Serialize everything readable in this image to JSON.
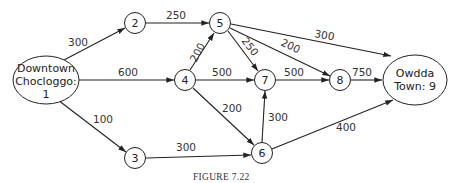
{
  "figure": {
    "caption": "Figure 7.22",
    "caption_display": "FIGURE 7.22"
  },
  "nodes": [
    {
      "id": "1",
      "label_lines": [
        "Downtown",
        "Chocloggo:",
        "1"
      ],
      "shape": "ellipse"
    },
    {
      "id": "2",
      "label": "2",
      "shape": "circle"
    },
    {
      "id": "3",
      "label": "3",
      "shape": "circle"
    },
    {
      "id": "4",
      "label": "4",
      "shape": "circle"
    },
    {
      "id": "5",
      "label": "5",
      "shape": "circle"
    },
    {
      "id": "6",
      "label": "6",
      "shape": "circle"
    },
    {
      "id": "7",
      "label": "7",
      "shape": "circle"
    },
    {
      "id": "8",
      "label": "8",
      "shape": "circle"
    },
    {
      "id": "9",
      "label_lines": [
        "Owdda",
        "Town: 9"
      ],
      "shape": "ellipse"
    }
  ],
  "edges": [
    {
      "from": "1",
      "to": "2",
      "weight": "300"
    },
    {
      "from": "1",
      "to": "4",
      "weight": "600"
    },
    {
      "from": "1",
      "to": "3",
      "weight": "100"
    },
    {
      "from": "2",
      "to": "5",
      "weight": "250"
    },
    {
      "from": "4",
      "to": "5",
      "weight": "200"
    },
    {
      "from": "4",
      "to": "7",
      "weight": "500"
    },
    {
      "from": "4",
      "to": "6",
      "weight": "200"
    },
    {
      "from": "5",
      "to": "7",
      "weight": "250"
    },
    {
      "from": "5",
      "to": "8",
      "weight": "200"
    },
    {
      "from": "5",
      "to": "9",
      "weight": "300"
    },
    {
      "from": "3",
      "to": "6",
      "weight": "300"
    },
    {
      "from": "6",
      "to": "7",
      "weight": "300"
    },
    {
      "from": "7",
      "to": "8",
      "weight": "500"
    },
    {
      "from": "8",
      "to": "9",
      "weight": "750"
    },
    {
      "from": "6",
      "to": "9",
      "weight": "400"
    }
  ]
}
